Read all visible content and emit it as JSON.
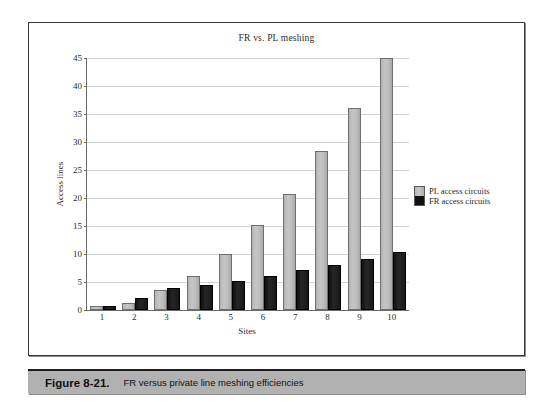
{
  "figure": {
    "caption_number": "Figure 8-21.",
    "caption_text": "FR versus private line meshing efficiencies"
  },
  "chart_data": {
    "type": "bar",
    "title": "FR vs. PL meshing",
    "xlabel": "Sites",
    "ylabel": "Access lines",
    "categories": [
      "1",
      "2",
      "3",
      "4",
      "5",
      "6",
      "7",
      "8",
      "9",
      "10"
    ],
    "series": [
      {
        "name": "PL access circuits",
        "color": "#bdbdbd",
        "values": [
          0.7,
          1.2,
          3.5,
          6.0,
          10.0,
          15.1,
          20.8,
          28.4,
          36.0,
          45.0
        ]
      },
      {
        "name": "FR access circuits",
        "color": "#141414",
        "values": [
          0.7,
          2.2,
          4.0,
          4.4,
          5.1,
          6.1,
          7.1,
          8.1,
          9.1,
          10.3
        ]
      }
    ],
    "ylim": [
      0,
      45
    ],
    "yticks": [
      0,
      5,
      10,
      15,
      20,
      25,
      30,
      35,
      40,
      45
    ],
    "ytick_labels": [
      "0",
      "5",
      "10",
      "15",
      "20",
      "25",
      "30",
      "35",
      "40",
      "45"
    ],
    "grid": true,
    "legend_position": "right"
  }
}
